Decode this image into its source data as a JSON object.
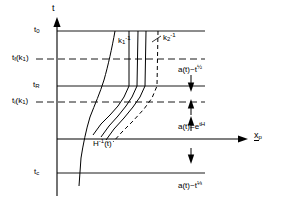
{
  "figure": {
    "background_color": "#ffffff",
    "line_color": "#000000",
    "width": 288,
    "height": 203
  },
  "axes": {
    "vertical": {
      "name": "t",
      "label": "t",
      "arrow": "up"
    },
    "horizontal": {
      "name": "x_p",
      "label": "x",
      "label_sub": "p",
      "arrow": "right"
    }
  },
  "time_ticks": [
    {
      "key": "t0",
      "label": "t",
      "sub": "0",
      "paren": "",
      "y": 31,
      "style": "solid"
    },
    {
      "key": "tf_k1",
      "label": "t",
      "sub": "f",
      "paren": "(k",
      "paren_sub": "1",
      "paren_end": ")",
      "y": 59,
      "style": "dashed"
    },
    {
      "key": "tR",
      "label": "t",
      "sub": "R",
      "paren": "",
      "y": 86,
      "style": "solid"
    },
    {
      "key": "ti_k1",
      "label": "t",
      "sub": "i",
      "paren": "(k",
      "paren_sub": "1",
      "paren_end": ")",
      "y": 102,
      "style": "dashed"
    },
    {
      "key": "tc",
      "label": "t",
      "sub": "c",
      "paren": "",
      "y": 173,
      "style": "solid"
    }
  ],
  "curve_labels": {
    "k1_inverse": {
      "base": "k",
      "sub": "1",
      "sup": "-1"
    },
    "k2_inverse": {
      "base": "k",
      "sub": "2",
      "sup": "-1"
    },
    "hubble_radius": {
      "base": "H",
      "sup": "-1",
      "arg": "(t)"
    }
  },
  "epoch_annotations": [
    {
      "key": "radiation_upper",
      "text": "a(t)~t",
      "exponent": "½",
      "x": 178,
      "y": 64
    },
    {
      "key": "inflation",
      "text": "a(t)=e",
      "exponent": "tH",
      "x": 178,
      "y": 121,
      "exponent_style": "sup"
    },
    {
      "key": "matter_lower",
      "text": "a(t)~t",
      "exponent": "⅓",
      "x": 178,
      "y": 180
    }
  ],
  "arrows": {
    "up_marker": "↑",
    "down_marker": "↓",
    "count": 4
  }
}
